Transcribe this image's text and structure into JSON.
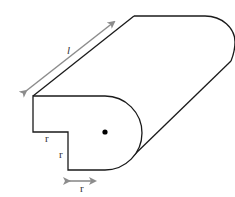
{
  "diagram": {
    "type": "3d-solid-with-dimensions",
    "colors": {
      "outline": "#1a1a1a",
      "dimension_arrow": "#8c8c8c",
      "label": "#333333",
      "center_dot": "#000000"
    },
    "labels": {
      "length": "l",
      "radius_horizontal_top": "r",
      "radius_vertical": "r",
      "radius_bottom_arrow": "r"
    }
  }
}
